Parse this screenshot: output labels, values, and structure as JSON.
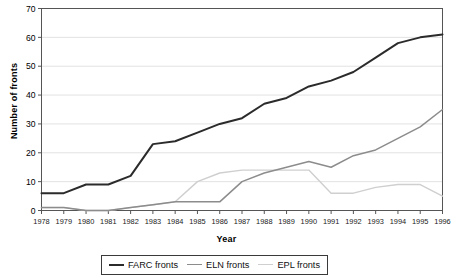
{
  "chart_data": {
    "type": "line",
    "title": "",
    "xlabel": "Year",
    "ylabel": "Number of fronts",
    "x": [
      1978,
      1979,
      1980,
      1981,
      1982,
      1983,
      1984,
      1985,
      1986,
      1987,
      1988,
      1989,
      1990,
      1991,
      1992,
      1993,
      1994,
      1995,
      1996
    ],
    "categories": [
      "1978",
      "1979",
      "1980",
      "1981",
      "1982",
      "1983",
      "1984",
      "1985",
      "1986",
      "1987",
      "1988",
      "1989",
      "1990",
      "1991",
      "1992",
      "1993",
      "1994",
      "1995",
      "1996"
    ],
    "ylim": [
      0,
      70
    ],
    "yticks": [
      0,
      10,
      20,
      30,
      40,
      50,
      60,
      70
    ],
    "grid": true,
    "legend_position": "bottom",
    "series": [
      {
        "name": "FARC fronts",
        "color": "#2b2b2b",
        "values": [
          6,
          6,
          9,
          9,
          12,
          23,
          24,
          27,
          30,
          32,
          37,
          39,
          43,
          45,
          48,
          53,
          58,
          60,
          61
        ]
      },
      {
        "name": "ELN fronts",
        "color": "#8c8c8c",
        "values": [
          1,
          1,
          0,
          0,
          1,
          2,
          3,
          3,
          3,
          10,
          13,
          15,
          17,
          15,
          19,
          21,
          25,
          29,
          35
        ]
      },
      {
        "name": "EPL fronts",
        "color": "#cfcfcf",
        "values": [
          1,
          1,
          0,
          0,
          1,
          2,
          3,
          10,
          13,
          14,
          14,
          14,
          14,
          6,
          6,
          8,
          9,
          9,
          5
        ]
      }
    ]
  },
  "legend": {
    "items": [
      {
        "label": "FARC fronts"
      },
      {
        "label": "ELN fronts"
      },
      {
        "label": "EPL fronts"
      }
    ]
  }
}
